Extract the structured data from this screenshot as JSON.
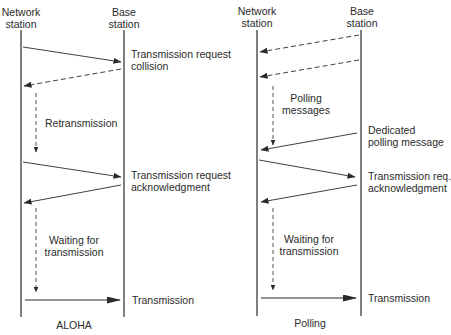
{
  "panels": [
    {
      "name": "ALOHA",
      "caption": "ALOHA",
      "network_station": [
        "Network",
        "station"
      ],
      "base_station": [
        "Base",
        "station"
      ],
      "labels": {
        "msg1": [
          "Transmission request",
          "collision"
        ],
        "retx": [
          "Retransmission"
        ],
        "msg2": [
          "Transmission request",
          "acknowledgment"
        ],
        "wait": [
          "Waiting for",
          "transmission"
        ],
        "tx": [
          "Transmission"
        ]
      }
    },
    {
      "name": "Polling",
      "caption": "Polling",
      "network_station": [
        "Network",
        "station"
      ],
      "base_station": [
        "Base",
        "station"
      ],
      "labels": {
        "poll": [
          "Polling",
          "messages"
        ],
        "dedicated": [
          "Dedicated",
          "polling message"
        ],
        "req": [
          "Transmission req.",
          "acknowledgment"
        ],
        "wait": [
          "Waiting for",
          "transmission"
        ],
        "tx": [
          "Transmission"
        ]
      }
    }
  ],
  "colors": {
    "line": "#2a2a2a",
    "background": "#ffffff"
  }
}
